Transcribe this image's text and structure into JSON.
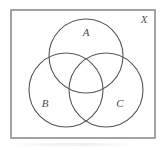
{
  "figure": {
    "kind": "venn-diagram",
    "universe": {
      "label": "X",
      "label_x": 144,
      "label_y": 20,
      "rect": {
        "x": 11,
        "y": 10,
        "width": 144,
        "height": 128
      },
      "border_color": "#8c8c8c",
      "border_width": 1.6,
      "fill_color": "#ffffff"
    },
    "circles": [
      {
        "name": "set-a",
        "label": "A",
        "cx": 86,
        "cy": 56,
        "r": 37,
        "label_x": 86,
        "label_y": 33,
        "stroke_color": "#55565a",
        "stroke_width": 1.1
      },
      {
        "name": "set-b",
        "label": "B",
        "cx": 66,
        "cy": 90,
        "r": 37,
        "label_x": 45,
        "label_y": 104,
        "stroke_color": "#55565a",
        "stroke_width": 1.1
      },
      {
        "name": "set-c",
        "label": "C",
        "cx": 106,
        "cy": 90,
        "r": 37,
        "label_x": 120,
        "label_y": 104,
        "stroke_color": "#55565a",
        "stroke_width": 1.1
      }
    ]
  }
}
